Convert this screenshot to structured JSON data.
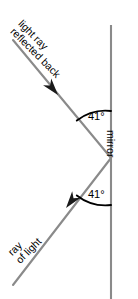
{
  "diagram": {
    "type": "optics-reflection-diagram",
    "background_color": "#ffffff",
    "ray_color": "#8a8a8a",
    "mirror_color": "#8a8a8a",
    "arc_color": "#000000",
    "text_color": "#000000",
    "labels": {
      "reflected_ray_line1": "light ray",
      "reflected_ray_line2": "reflected back",
      "incident_ray_line1": "ray",
      "incident_ray_line2": "of light",
      "mirror": "mirror"
    },
    "angles": {
      "reflection_angle": "41°",
      "incidence_angle": "41°"
    },
    "geometry": {
      "mirror_x": 111,
      "mirror_top_y": 25,
      "mirror_bottom_y": 299,
      "vertex_x": 111,
      "vertex_y": 158,
      "reflected_end_x": 13,
      "reflected_end_y": 40,
      "incident_start_x": 13,
      "incident_start_y": 285,
      "reflected_arrow_x": 58,
      "reflected_arrow_y": 95,
      "incident_arrow_x": 62,
      "incident_arrow_y": 212
    }
  }
}
